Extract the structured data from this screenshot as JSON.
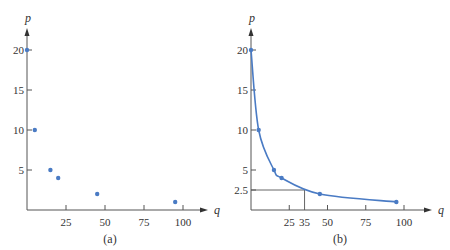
{
  "chart_data": [
    {
      "type": "scatter",
      "title": "",
      "caption": "(a)",
      "xlabel": "q",
      "ylabel": "p",
      "x_ticks": [
        25,
        50,
        75,
        100
      ],
      "x_tick_labels": [
        "25",
        "50",
        "75",
        "100"
      ],
      "y_ticks": [
        5,
        10,
        15,
        20
      ],
      "y_tick_labels": [
        "5",
        "10",
        "15",
        "20"
      ],
      "xlim": [
        0,
        110
      ],
      "ylim": [
        0,
        22
      ],
      "grid": false,
      "legend": null,
      "points": [
        {
          "q": 0,
          "p": 20
        },
        {
          "q": 5,
          "p": 10
        },
        {
          "q": 15,
          "p": 5
        },
        {
          "q": 20,
          "p": 4
        },
        {
          "q": 45,
          "p": 2
        },
        {
          "q": 95,
          "p": 1
        }
      ],
      "colors": {
        "points": "#4a7bc4",
        "axes": "#555555"
      }
    },
    {
      "type": "line",
      "title": "",
      "caption": "(b)",
      "xlabel": "q",
      "ylabel": "p",
      "x_ticks": [
        25,
        35,
        50,
        75,
        100
      ],
      "x_tick_labels": [
        "25",
        "35",
        "50",
        "75",
        "100"
      ],
      "y_ticks": [
        2.5,
        5,
        10,
        15,
        20
      ],
      "y_tick_labels": [
        "2.5",
        "5",
        "10",
        "15",
        "20"
      ],
      "xlim": [
        0,
        110
      ],
      "ylim": [
        0,
        22
      ],
      "grid": false,
      "legend": null,
      "points": [
        {
          "q": 0,
          "p": 20
        },
        {
          "q": 5,
          "p": 10
        },
        {
          "q": 15,
          "p": 5
        },
        {
          "q": 20,
          "p": 4
        },
        {
          "q": 45,
          "p": 2
        },
        {
          "q": 95,
          "p": 1
        }
      ],
      "smooth_curve": true,
      "annotations": [
        {
          "type": "guide-lines",
          "q": 35,
          "p": 2.5,
          "description": "horizontal line from p-axis at 2.5 to curve, vertical line down to q=35"
        }
      ],
      "colors": {
        "points": "#4a7bc4",
        "curve": "#4a7bc4",
        "axes": "#555555"
      }
    }
  ]
}
